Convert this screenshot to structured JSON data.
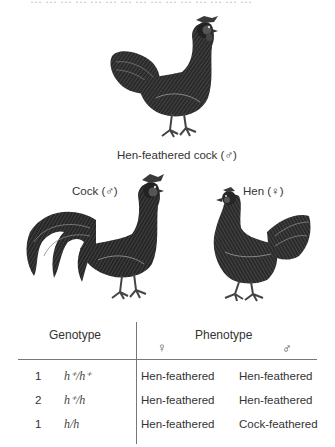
{
  "top_fragment": "… … … … … … … … … … … … … … …",
  "figures": {
    "hen_feathered_cock": {
      "caption": "Hen-feathered cock (♂)"
    },
    "cock": {
      "caption": "Cock (♂)"
    },
    "hen": {
      "caption": "Hen (♀)"
    }
  },
  "table": {
    "genotype_header": "Genotype",
    "phenotype_header": "Phenotype",
    "female_symbol": "♀",
    "male_symbol": "♂",
    "rows": [
      {
        "ratio": "1",
        "genotype": "h⁺/h⁺",
        "female": "Hen-feathered",
        "male": "Hen-feathered"
      },
      {
        "ratio": "2",
        "genotype": "h⁺/h",
        "female": "Hen-feathered",
        "male": "Hen-feathered"
      },
      {
        "ratio": "1",
        "genotype": "h/h",
        "female": "Hen-feathered",
        "male": "Cock-feathered"
      }
    ]
  },
  "colors": {
    "line": "#777777",
    "ink": "#2a2a2a",
    "plumage_dark": "#1e1e1e",
    "plumage_mid": "#4a4a4a",
    "comb": "#5a5a5a"
  }
}
